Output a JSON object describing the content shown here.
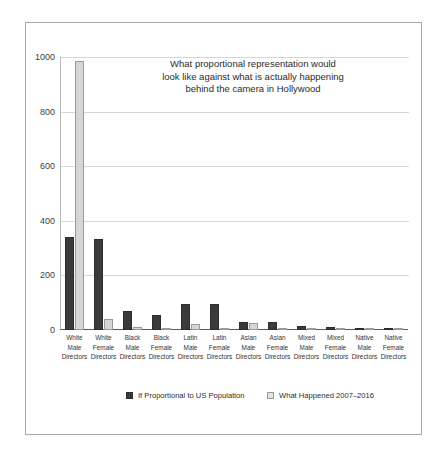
{
  "chart_data": {
    "type": "bar",
    "title": "What proportional representation would look like against what is actually happening behind the camera in Hollywood",
    "title_lines": [
      "What proportional representation would",
      "look like against what is actually happening",
      "behind the camera in Hollywood"
    ],
    "xlabel": "",
    "ylabel": "",
    "ylim": [
      0,
      1000
    ],
    "yticks": [
      0,
      200,
      400,
      600,
      800,
      1000
    ],
    "ytick_labels": [
      "0",
      "200",
      "400",
      "600",
      "800",
      "1000"
    ],
    "grid": true,
    "legend_position": "bottom",
    "categories": [
      "White Male Directors",
      "White Female Directors",
      "Black Male Directors",
      "Black Female Directors",
      "Latin Male Directors",
      "Latin Female Directors",
      "Asian Male Directors",
      "Asian Female Directors",
      "Mixed Male Directors",
      "Mixed Female Directors",
      "Native Male Directors",
      "Native Female Directors"
    ],
    "category_lines": [
      [
        "White",
        "Male",
        "Directors"
      ],
      [
        "White",
        "Female",
        "Directors"
      ],
      [
        "Black",
        "Male",
        "Directors"
      ],
      [
        "Black",
        "Female",
        "Directors"
      ],
      [
        "Latin",
        "Male",
        "Directors"
      ],
      [
        "Latin",
        "Female",
        "Directors"
      ],
      [
        "Asian",
        "Male",
        "Directors"
      ],
      [
        "Asian",
        "Female",
        "Directors"
      ],
      [
        "Mixed",
        "Male",
        "Directors"
      ],
      [
        "Mixed",
        "Female",
        "Directors"
      ],
      [
        "Native",
        "Male",
        "Directors"
      ],
      [
        "Native",
        "Female",
        "Directors"
      ]
    ],
    "series": [
      {
        "name": "If Proportional to US Population",
        "color": "#3a3a3a",
        "values": [
          340,
          335,
          70,
          55,
          95,
          95,
          30,
          28,
          13,
          12,
          6,
          6
        ]
      },
      {
        "name": "What Happened 2007–2016",
        "color": "#d6d6d6",
        "values": [
          985,
          40,
          10,
          3,
          22,
          2,
          26,
          3,
          2,
          1,
          1,
          1
        ]
      }
    ]
  },
  "legend": {
    "items": [
      {
        "label": "If Proportional to US Population",
        "swatch": "dark"
      },
      {
        "label": "What Happened 2007–2016",
        "swatch": "light"
      }
    ]
  }
}
